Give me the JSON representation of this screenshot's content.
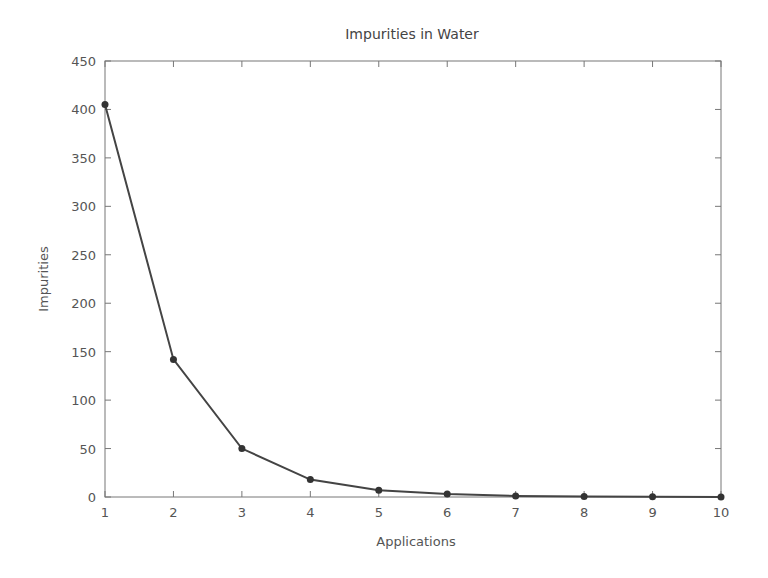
{
  "chart_data": {
    "type": "line",
    "title": "Impurities in Water",
    "xlabel": "Applications",
    "ylabel": "Impurities",
    "x": [
      1,
      2,
      3,
      4,
      5,
      6,
      7,
      8,
      9,
      10
    ],
    "series": [
      {
        "name": "Impurities",
        "values": [
          405,
          142,
          50,
          18,
          7,
          3,
          1,
          0.5,
          0.2,
          0.1
        ],
        "color": "#444444",
        "marker": "circle"
      }
    ],
    "xlim": [
      1,
      10
    ],
    "ylim": [
      0,
      450
    ],
    "xticks": [
      "1",
      "2",
      "3",
      "4",
      "5",
      "6",
      "7",
      "8",
      "9",
      "10"
    ],
    "yticks": [
      "0",
      "50",
      "100",
      "150",
      "200",
      "250",
      "300",
      "350",
      "400",
      "450"
    ],
    "grid": false,
    "legend": null
  }
}
